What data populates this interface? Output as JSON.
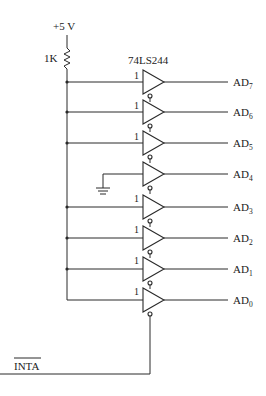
{
  "diagram": {
    "supply_label": "+5 V",
    "resistor_label": "1K",
    "chip_label": "74LS244",
    "enable_signal": "INTA",
    "input_high_label": "1",
    "ground_symbol": "ground-icon",
    "outputs": [
      {
        "prefix": "AD",
        "sub": "7",
        "input": "1"
      },
      {
        "prefix": "AD",
        "sub": "6",
        "input": "1"
      },
      {
        "prefix": "AD",
        "sub": "5",
        "input": "1"
      },
      {
        "prefix": "AD",
        "sub": "4",
        "input": "GND"
      },
      {
        "prefix": "AD",
        "sub": "3",
        "input": "1"
      },
      {
        "prefix": "AD",
        "sub": "2",
        "input": "1"
      },
      {
        "prefix": "AD",
        "sub": "1",
        "input": "1"
      },
      {
        "prefix": "AD",
        "sub": "0",
        "input": "1"
      }
    ]
  }
}
